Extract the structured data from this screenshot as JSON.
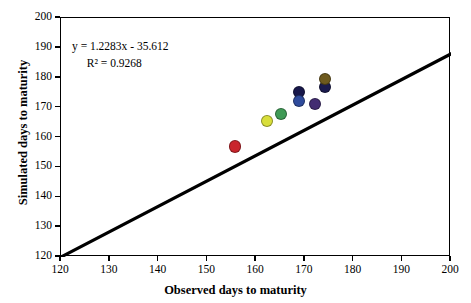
{
  "chart_data": {
    "type": "scatter",
    "title": "",
    "xlabel": "Observed days to maturity",
    "ylabel": "Simulated days to maturity",
    "xlim": [
      120,
      200
    ],
    "ylim": [
      120,
      200
    ],
    "xticks": [
      120,
      130,
      140,
      150,
      160,
      170,
      180,
      190,
      200
    ],
    "yticks": [
      120,
      130,
      140,
      150,
      160,
      170,
      180,
      190,
      200
    ],
    "grid": false,
    "legend": "none",
    "annotations": {
      "equation": "y = 1.2283x - 35.612",
      "r_squared": "R² = 0.9268"
    },
    "regression": {
      "slope": 1.2283,
      "intercept": -35.612,
      "r2": 0.9268,
      "line_x": [
        120,
        200
      ],
      "line_y": [
        120,
        188
      ]
    },
    "points": [
      {
        "name": "point-red",
        "x": 155.7,
        "y": 157.0,
        "color": "#c9252c"
      },
      {
        "name": "point-yellow",
        "x": 162.3,
        "y": 165.5,
        "color": "#d8de3a"
      },
      {
        "name": "point-green",
        "x": 165.1,
        "y": 167.9,
        "color": "#3f9a55"
      },
      {
        "name": "point-navy",
        "x": 168.8,
        "y": 175.2,
        "color": "#17174a"
      },
      {
        "name": "point-blue",
        "x": 168.8,
        "y": 172.2,
        "color": "#2f4b9c"
      },
      {
        "name": "point-purple",
        "x": 172.1,
        "y": 171.2,
        "color": "#432d72"
      },
      {
        "name": "point-darknavy-2",
        "x": 174.2,
        "y": 177.0,
        "color": "#1b1b4e"
      },
      {
        "name": "point-olive",
        "x": 174.2,
        "y": 179.5,
        "color": "#6e5a1e"
      }
    ]
  }
}
